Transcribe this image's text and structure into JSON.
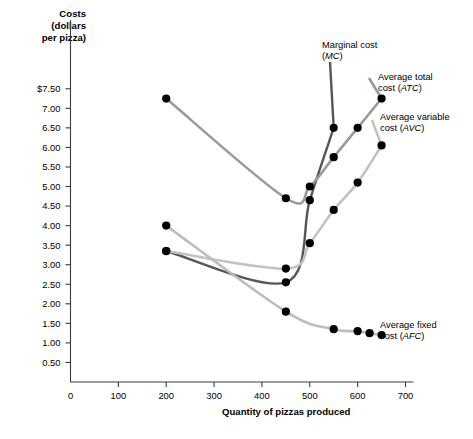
{
  "chart_data": {
    "type": "line",
    "title": "",
    "ylabel": "Costs (dollars per pizza)",
    "xlabel": "Quantity of pizzas produced",
    "xlim": [
      0,
      700
    ],
    "ylim": [
      0,
      7.75
    ],
    "grid": false,
    "legend_position": "inline-annotations",
    "xticks": [
      0,
      100,
      200,
      300,
      400,
      500,
      600,
      700
    ],
    "xticklabels": [
      "0",
      "100",
      "200",
      "300",
      "400",
      "500",
      "600",
      "700"
    ],
    "yticks": [
      0.5,
      1.0,
      1.5,
      2.0,
      2.5,
      3.0,
      3.5,
      4.0,
      4.5,
      5.0,
      5.5,
      6.0,
      6.5,
      7.0,
      7.5
    ],
    "yticklabels": [
      "0.50",
      "1.00",
      "1.50",
      "2.00",
      "2.50",
      "3.00",
      "3.50",
      "4.00",
      "4.50",
      "5.00",
      "5.50",
      "6.00",
      "6.50",
      "7.00",
      "$7.50"
    ],
    "series": [
      {
        "name": "Marginal cost (MC)",
        "abbrev": "MC",
        "color": "#55555c",
        "x": [
          200,
          450,
          500,
          550
        ],
        "values": [
          3.35,
          2.55,
          4.65,
          6.5
        ]
      },
      {
        "name": "Average total cost (ATC)",
        "abbrev": "ATC",
        "color": "#9a9a9e",
        "x": [
          200,
          450,
          500,
          550,
          600,
          650
        ],
        "values": [
          7.25,
          4.7,
          5.0,
          5.75,
          6.5,
          7.25
        ]
      },
      {
        "name": "Average variable cost (AVC)",
        "abbrev": "AVC",
        "color": "#c2c2c6",
        "x": [
          200,
          450,
          500,
          550,
          600,
          650
        ],
        "values": [
          3.35,
          2.9,
          3.55,
          4.4,
          5.1,
          6.05
        ]
      },
      {
        "name": "Average fixed cost (AFC)",
        "abbrev": "AFC",
        "color": "#bcbcc0",
        "x": [
          200,
          450,
          550,
          600,
          625,
          650
        ],
        "values": [
          4.0,
          1.8,
          1.35,
          1.3,
          1.25,
          1.2
        ]
      }
    ]
  },
  "axes": {
    "y_title_line1": "Costs",
    "y_title_line2": "(dollars",
    "y_title_line3": "per pizza)",
    "x_title": "Quantity of pizzas produced"
  },
  "annotations": {
    "mc": {
      "line1": "Marginal cost",
      "line2_paren_open": "(",
      "line2_abbrev": "MC",
      "line2_paren_close": ")"
    },
    "atc": {
      "line1": "Average total",
      "line2_prefix": "cost (",
      "line2_abbrev": "ATC",
      "line2_suffix": ")"
    },
    "avc": {
      "line1": "Average variable",
      "line2_prefix": "cost (",
      "line2_abbrev": "AVC",
      "line2_suffix": ")"
    },
    "afc": {
      "line1": "Average fixed",
      "line2_prefix": "cost (",
      "line2_abbrev": "AFC",
      "line2_suffix": ")"
    }
  }
}
